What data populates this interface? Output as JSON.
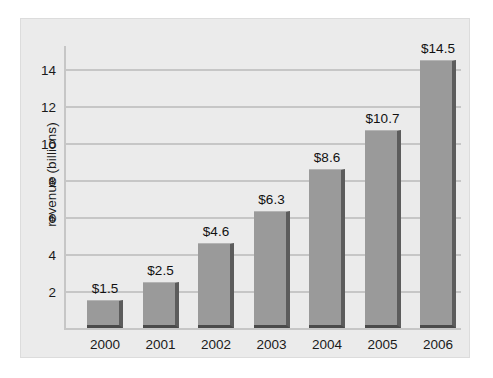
{
  "chart_data": {
    "type": "bar",
    "title": "",
    "subtitle": "",
    "xlabel": "",
    "ylabel": "revenue (billions)",
    "categories": [
      "2000",
      "2001",
      "2002",
      "2003",
      "2004",
      "2005",
      "2006"
    ],
    "values": [
      1.5,
      2.5,
      4.6,
      6.3,
      8.6,
      10.7,
      14.5
    ],
    "value_labels": [
      "$1.5",
      "$2.5",
      "$4.6",
      "$6.3",
      "$8.6",
      "$10.7",
      "$14.5"
    ],
    "ylim": [
      0,
      15.5
    ],
    "ytick_labels": [
      "2",
      "4",
      "6",
      "8",
      "10",
      "12",
      "14"
    ],
    "ytick_values": [
      2,
      4,
      6,
      8,
      10,
      12,
      14
    ],
    "grid": true,
    "legend": false,
    "colors": {
      "panel_background": "#ebebeb",
      "page_background": "#ffffff",
      "gridline": "#c6c6c6",
      "bar_face": "#9a9a9a",
      "bar_side_shadow": "#5c5c5c",
      "bar_bottom_shadow": "#4a4a4a",
      "text": "#1a1a1a"
    }
  }
}
